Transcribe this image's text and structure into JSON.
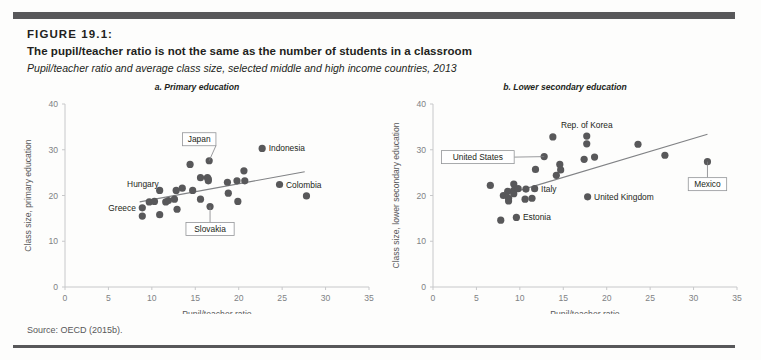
{
  "figure": {
    "number": "FIGURE 19.1:",
    "title": "The pupil/teacher ratio is not the same as the number of students in a classroom",
    "subtitle": "Pupil/teacher ratio and average class size, selected middle and high income countries, 2013",
    "source": "Source: OECD (2015b)."
  },
  "chart_data": [
    {
      "type": "scatter",
      "id": "panel-a",
      "title": "a. Primary education",
      "xlabel": "Pupil/teacher ratio",
      "ylabel": "Class size, primary education",
      "xlim": [
        0,
        35
      ],
      "ylim": [
        0,
        40
      ],
      "xticks": [
        0,
        5,
        10,
        15,
        20,
        25,
        30,
        35
      ],
      "yticks": [
        0,
        10,
        20,
        30,
        40
      ],
      "grid": false,
      "legend": "none",
      "marker_color": "#58585a",
      "trendline": {
        "x0": 8.6,
        "y0": 18.6,
        "x1": 27.6,
        "y1": 25.2,
        "color": "#808285"
      },
      "points": [
        {
          "x": 8.9,
          "y": 17.3,
          "label": "Greece",
          "label_pos": "left"
        },
        {
          "x": 8.9,
          "y": 15.5
        },
        {
          "x": 9.7,
          "y": 18.6
        },
        {
          "x": 10.3,
          "y": 18.7
        },
        {
          "x": 10.9,
          "y": 21.1
        },
        {
          "x": 10.9,
          "y": 15.8
        },
        {
          "x": 11.6,
          "y": 18.6
        },
        {
          "x": 11.9,
          "y": 18.9
        },
        {
          "x": 12.6,
          "y": 19.2
        },
        {
          "x": 12.8,
          "y": 21.1
        },
        {
          "x": 12.9,
          "y": 17.0
        },
        {
          "x": 13.5,
          "y": 21.6
        },
        {
          "x": 14.4,
          "y": 26.8
        },
        {
          "x": 14.7,
          "y": 21.1
        },
        {
          "x": 15.6,
          "y": 23.9
        },
        {
          "x": 15.6,
          "y": 19.2
        },
        {
          "x": 16.4,
          "y": 23.9
        },
        {
          "x": 16.5,
          "y": 23.2
        },
        {
          "x": 16.5,
          "y": 23.6
        },
        {
          "x": 16.6,
          "y": 27.6,
          "label": "Japan",
          "label_pos": "callout-up"
        },
        {
          "x": 16.7,
          "y": 17.6,
          "label": "Slovakia",
          "label_pos": "callout-down"
        },
        {
          "x": 18.7,
          "y": 22.9
        },
        {
          "x": 18.8,
          "y": 20.5
        },
        {
          "x": 19.8,
          "y": 23.2
        },
        {
          "x": 19.9,
          "y": 18.7
        },
        {
          "x": 20.6,
          "y": 25.4
        },
        {
          "x": 20.7,
          "y": 23.2
        },
        {
          "x": 22.7,
          "y": 30.3,
          "label": "Indonesia",
          "label_pos": "right"
        },
        {
          "x": 24.7,
          "y": 22.4,
          "label": "Colombia",
          "label_pos": "right"
        },
        {
          "x": 27.8,
          "y": 19.9
        }
      ],
      "annotations": [
        {
          "text": "Hungary",
          "type": "plain"
        },
        {
          "text": "Greece",
          "type": "plain"
        },
        {
          "text": "Japan",
          "type": "boxed"
        },
        {
          "text": "Slovakia",
          "type": "boxed"
        },
        {
          "text": "Indonesia",
          "type": "plain"
        },
        {
          "text": "Colombia",
          "type": "plain"
        }
      ]
    },
    {
      "type": "scatter",
      "id": "panel-b",
      "title": "b. Lower secondary education",
      "xlabel": "Pupil/teacher ratio",
      "ylabel": "Class size, lower secondary education",
      "xlim": [
        0,
        35
      ],
      "ylim": [
        0,
        40
      ],
      "xticks": [
        0,
        5,
        10,
        15,
        20,
        25,
        30,
        35
      ],
      "yticks": [
        0,
        10,
        20,
        30,
        40
      ],
      "grid": false,
      "legend": "none",
      "marker_color": "#58585a",
      "trendline": {
        "x0": 9.6,
        "y0": 20.9,
        "x1": 31.6,
        "y1": 33.4,
        "color": "#808285"
      },
      "points": [
        {
          "x": 6.6,
          "y": 22.2
        },
        {
          "x": 7.8,
          "y": 14.6
        },
        {
          "x": 8.1,
          "y": 20.0
        },
        {
          "x": 8.6,
          "y": 20.9
        },
        {
          "x": 8.7,
          "y": 19.4
        },
        {
          "x": 8.7,
          "y": 18.8
        },
        {
          "x": 9.3,
          "y": 22.5
        },
        {
          "x": 9.3,
          "y": 21.1
        },
        {
          "x": 9.3,
          "y": 20.4
        },
        {
          "x": 9.6,
          "y": 15.2,
          "label": "Estonia",
          "label_pos": "right"
        },
        {
          "x": 9.8,
          "y": 21.5
        },
        {
          "x": 10.6,
          "y": 19.2
        },
        {
          "x": 10.7,
          "y": 21.4
        },
        {
          "x": 11.4,
          "y": 19.4
        },
        {
          "x": 11.7,
          "y": 21.5,
          "label": "Italy",
          "label_pos": "right"
        },
        {
          "x": 11.8,
          "y": 25.7
        },
        {
          "x": 12.8,
          "y": 28.5,
          "label": "United States",
          "label_pos": "callout-left"
        },
        {
          "x": 13.8,
          "y": 32.8
        },
        {
          "x": 14.2,
          "y": 24.4
        },
        {
          "x": 14.6,
          "y": 26.8
        },
        {
          "x": 14.7,
          "y": 25.6
        },
        {
          "x": 17.4,
          "y": 27.9
        },
        {
          "x": 17.7,
          "y": 33.0,
          "label": "Rep. of Korea",
          "label_pos": "above"
        },
        {
          "x": 17.7,
          "y": 31.3
        },
        {
          "x": 17.8,
          "y": 19.7,
          "label": "United Kingdom",
          "label_pos": "right"
        },
        {
          "x": 18.6,
          "y": 28.4
        },
        {
          "x": 23.6,
          "y": 31.2
        },
        {
          "x": 26.7,
          "y": 28.8
        },
        {
          "x": 31.6,
          "y": 27.4,
          "label": "Mexico",
          "label_pos": "callout-down"
        }
      ],
      "annotations": [
        {
          "text": "United States",
          "type": "boxed"
        },
        {
          "text": "Mexico",
          "type": "boxed"
        },
        {
          "text": "Rep. of Korea",
          "type": "plain"
        },
        {
          "text": "Italy",
          "type": "plain"
        },
        {
          "text": "Estonia",
          "type": "plain"
        },
        {
          "text": "United Kingdom",
          "type": "plain"
        }
      ]
    }
  ],
  "colors": {
    "rule": "#58585a",
    "marker": "#58585a",
    "axis": "#c7c8ca",
    "trend": "#808285",
    "text": "#231f20"
  }
}
